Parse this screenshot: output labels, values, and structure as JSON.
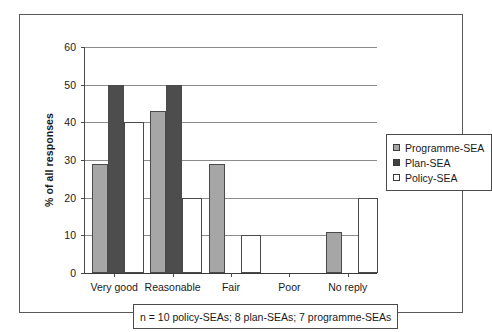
{
  "chart_data": {
    "type": "bar",
    "title": "",
    "xlabel": "",
    "ylabel": "% of all responses",
    "categories": [
      "Very good",
      "Reasonable",
      "Fair",
      "Poor",
      "No reply"
    ],
    "series": [
      {
        "name": "Programme-SEA",
        "color": "#a6a6a6",
        "values": [
          29,
          43,
          29,
          0,
          11
        ]
      },
      {
        "name": "Plan-SEA",
        "color": "#4d4d4d",
        "values": [
          50,
          50,
          0,
          0,
          0
        ]
      },
      {
        "name": "Policy-SEA",
        "color": "#ffffff",
        "values": [
          40,
          20,
          10,
          0,
          20
        ]
      }
    ],
    "ylim": [
      0,
      60
    ],
    "yticks": [
      0,
      10,
      20,
      30,
      40,
      50,
      60
    ],
    "ytick_labels": [
      "0",
      "10",
      "20",
      "30",
      "40",
      "50",
      "60"
    ],
    "grid": true,
    "legend_position": "right",
    "annotation": "n = 10 policy-SEAs; 8 plan-SEAs; 7 programme-SEAs"
  },
  "legend": {
    "items": [
      {
        "label": "Programme-SEA",
        "swatch": "programme"
      },
      {
        "label": "Plan-SEA",
        "swatch": "plan"
      },
      {
        "label": "Policy-SEA",
        "swatch": "policy"
      }
    ]
  },
  "caption": {
    "text": "n = 10 policy-SEAs; 8 plan-SEAs; 7 programme-SEAs"
  },
  "axis": {
    "y_title": "% of all responses"
  }
}
